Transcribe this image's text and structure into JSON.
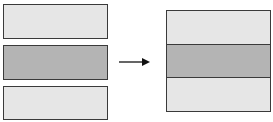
{
  "diagram": {
    "colors": {
      "light": "#e6e6e6",
      "dark": "#b4b4b4",
      "border": "#3a3a3a",
      "arrow": "#111111"
    },
    "left_bars": [
      {
        "shade": "light"
      },
      {
        "shade": "dark"
      },
      {
        "shade": "light"
      }
    ],
    "right_stack": [
      {
        "shade": "light"
      },
      {
        "shade": "dark"
      },
      {
        "shade": "light"
      }
    ],
    "arrow": {
      "direction": "right"
    }
  }
}
